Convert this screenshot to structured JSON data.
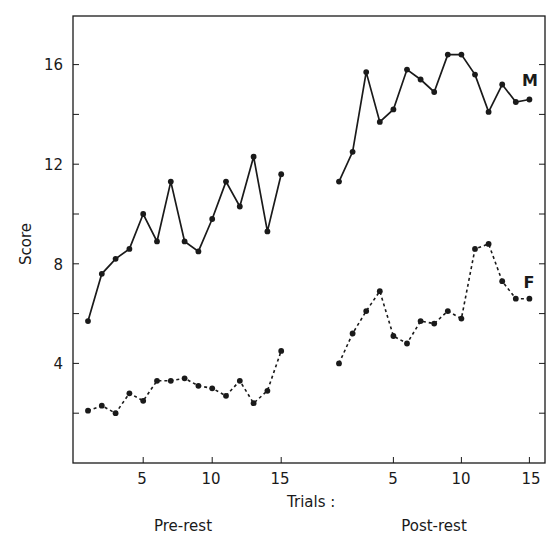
{
  "chart_data": {
    "type": "line",
    "title": "",
    "xlabel": "Trials :",
    "ylabel": "Score",
    "ylim": [
      0,
      18
    ],
    "yticks_major": [
      4,
      8,
      12,
      16
    ],
    "yticks_minor": [
      2,
      6,
      10,
      14
    ],
    "grid": false,
    "panels": [
      {
        "name": "Pre-rest",
        "x": [
          1,
          2,
          3,
          4,
          5,
          6,
          7,
          8,
          9,
          10,
          11,
          12,
          13,
          14,
          15
        ],
        "xtick_labels": [
          "5",
          "10",
          "15"
        ],
        "xticks": [
          5,
          10,
          15
        ]
      },
      {
        "name": "Post-rest",
        "x": [
          1,
          2,
          3,
          4,
          5,
          6,
          7,
          8,
          9,
          10,
          11,
          12,
          13,
          14,
          15
        ],
        "xtick_labels": [
          "5",
          "10",
          "15"
        ],
        "xticks": [
          5,
          10,
          15
        ]
      }
    ],
    "series": [
      {
        "name": "M",
        "style": "solid",
        "pre_rest": [
          5.7,
          7.6,
          8.2,
          8.6,
          10.0,
          8.9,
          11.3,
          8.9,
          8.5,
          9.8,
          11.3,
          10.3,
          12.3,
          9.3,
          11.6
        ],
        "post_rest": [
          11.3,
          12.5,
          15.7,
          13.7,
          14.2,
          15.8,
          15.4,
          14.9,
          16.4,
          16.4,
          15.6,
          14.1,
          15.2,
          14.5,
          14.6
        ]
      },
      {
        "name": "F",
        "style": "dashed",
        "pre_rest": [
          2.1,
          2.3,
          2.0,
          2.8,
          2.5,
          3.3,
          3.3,
          3.4,
          3.1,
          3.0,
          2.7,
          3.3,
          2.4,
          2.9,
          4.5
        ],
        "post_rest": [
          4.0,
          5.2,
          6.1,
          6.9,
          5.1,
          4.8,
          5.7,
          5.6,
          6.1,
          5.8,
          8.6,
          8.8,
          7.3,
          6.6,
          6.6
        ]
      }
    ],
    "legend": "inline labels at right end of each series (M, F)"
  },
  "labels": {
    "y_axis_title": "Score",
    "x_axis_title": "Trials :",
    "panel_pre": "Pre-rest",
    "panel_post": "Post-rest",
    "series_m": "M",
    "series_f": "F",
    "ytick_16": "16",
    "ytick_12": "12",
    "ytick_8": "8",
    "ytick_4": "4"
  },
  "colors": {
    "ink": "#1a1a1a",
    "background": "#ffffff"
  }
}
